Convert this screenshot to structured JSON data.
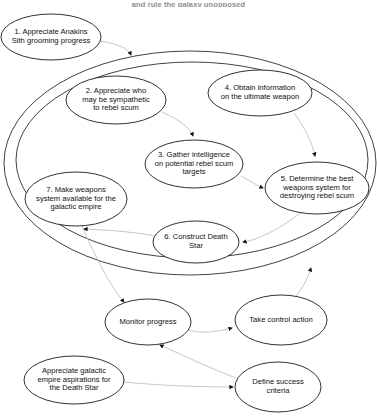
{
  "caption": {
    "text": "and rule the galaxy unopposed"
  },
  "colors": {
    "stroke": "#1a1a1a",
    "faint_stroke": "#b9b9b9",
    "text": "#101010",
    "background": "#ffffff"
  },
  "diagram": {
    "nodes": [
      {
        "id": "node-1",
        "name": "appreciate-anakins-sith-grooming-progress",
        "label": "1. Appreciate Anakins\nSith grooming progress",
        "cx": 51,
        "cy": 37,
        "rx": 50,
        "ry": 23,
        "font_size": 7.6
      },
      {
        "id": "node-2",
        "name": "appreciate-who-may-be-sympathetic-to-rebel-scum",
        "label": "2. Appreciate who\nmay be sympathetic\nto rebel scum",
        "cx": 116,
        "cy": 100,
        "rx": 50,
        "ry": 24,
        "font_size": 7.6
      },
      {
        "id": "node-4",
        "name": "obtain-information-on-the-ultimate-weapon",
        "label": "4. Obtain information\non the ultimate weapon",
        "cx": 260,
        "cy": 93,
        "rx": 52,
        "ry": 23,
        "font_size": 7.6
      },
      {
        "id": "node-3",
        "name": "gather-intelligence-on-potential-rebel-scum-targets",
        "label": "3. Gather intelligence\non potential rebel scum\ntargets",
        "cx": 194,
        "cy": 164,
        "rx": 49,
        "ry": 24,
        "font_size": 7.6
      },
      {
        "id": "node-5",
        "name": "determine-the-best-weapons-system-for-destroying-rebel-scum",
        "label": "5. Determine the best\nweapons system for\ndestroying rebel scum",
        "cx": 317,
        "cy": 188,
        "rx": 52,
        "ry": 26,
        "font_size": 7.6
      },
      {
        "id": "node-7",
        "name": "make-weapons-system-available-for-the-galactic-empire",
        "label": "7. Make weapons\nsystem available for the\ngalactic empire",
        "cx": 76,
        "cy": 199,
        "rx": 51,
        "ry": 27,
        "font_size": 7.6
      },
      {
        "id": "node-6",
        "name": "construct-death-star",
        "label": "6. Construct Death\nStar",
        "cx": 196,
        "cy": 242,
        "rx": 43,
        "ry": 21,
        "font_size": 7.6
      },
      {
        "id": "node-monitor",
        "name": "monitor-progress",
        "label": "Monitor progress",
        "cx": 148,
        "cy": 322,
        "rx": 43,
        "ry": 23,
        "font_size": 7.6
      },
      {
        "id": "node-control",
        "name": "take-control-action",
        "label": "Take control action",
        "cx": 281,
        "cy": 320,
        "rx": 46,
        "ry": 25,
        "font_size": 7.6
      },
      {
        "id": "node-aspirations",
        "name": "appreciate-galactic-empire-aspirations-for-the-death-star",
        "label": "Appreciate galactic\nempire aspirations for\nthe Death Star",
        "cx": 74,
        "cy": 380,
        "rx": 50,
        "ry": 24,
        "font_size": 7.6
      },
      {
        "id": "node-success",
        "name": "define-success-criteria",
        "label": "Define success\ncriteria",
        "cx": 278,
        "cy": 387,
        "rx": 43,
        "ry": 25,
        "font_size": 7.6
      }
    ],
    "containers": [
      {
        "id": "outer-boundary",
        "name": "outer-system-boundary",
        "cx": 190,
        "cy": 163,
        "rx": 186,
        "ry": 112
      },
      {
        "id": "inner-boundary",
        "name": "inner-system-boundary",
        "cx": 192,
        "cy": 160,
        "rx": 176,
        "ry": 98
      }
    ],
    "edges": [
      {
        "id": "e1",
        "name": "edge-node1-to-boundary",
        "from": "node-1",
        "to": "outer-boundary"
      },
      {
        "id": "e2",
        "name": "edge-node2-to-node3",
        "from": "node-2",
        "to": "node-3"
      },
      {
        "id": "e3",
        "name": "edge-node4-to-node5",
        "from": "node-4",
        "to": "node-5"
      },
      {
        "id": "e4",
        "name": "edge-node3-to-node5",
        "from": "node-3",
        "to": "node-5"
      },
      {
        "id": "e5",
        "name": "edge-node5-to-node6",
        "from": "node-5",
        "to": "node-6"
      },
      {
        "id": "e6",
        "name": "edge-node6-to-node7",
        "from": "node-6",
        "to": "node-7"
      },
      {
        "id": "e7",
        "name": "edge-node7-to-monitor",
        "from": "node-7",
        "to": "node-monitor"
      },
      {
        "id": "e8",
        "name": "edge-monitor-to-control",
        "from": "node-monitor",
        "to": "node-control"
      },
      {
        "id": "e9",
        "name": "edge-control-to-boundary",
        "from": "node-control",
        "to": "outer-boundary"
      },
      {
        "id": "e10",
        "name": "edge-success-to-monitor",
        "from": "node-success",
        "to": "node-monitor"
      },
      {
        "id": "e11",
        "name": "edge-aspirations-to-success",
        "from": "node-aspirations",
        "to": "node-success"
      }
    ]
  }
}
